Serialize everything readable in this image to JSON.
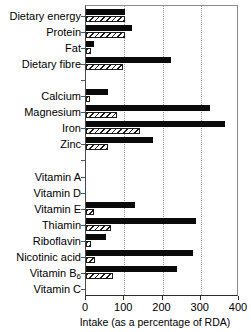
{
  "chart_data": {
    "type": "bar",
    "orientation": "horizontal",
    "title": "",
    "xlabel": "Intake (as a percentage of RDA)",
    "ylabel": "",
    "xlim": [
      0,
      400
    ],
    "xticks": [
      0,
      100,
      200,
      300,
      400
    ],
    "xticklabels": [
      "0",
      "100",
      "200",
      "300",
      "400"
    ],
    "grid": "vertical-dotted",
    "legend": "none",
    "series": [
      {
        "name": "solid",
        "style": "solid-black"
      },
      {
        "name": "hatched",
        "style": "diagonal-hatch"
      }
    ],
    "categories": [
      "Dietary energy",
      "Protein",
      "Fat",
      "Dietary fibre",
      "",
      "Calcium",
      "Magnesium",
      "Iron",
      "Zinc",
      "",
      "Vitamin A",
      "Vitamin D",
      "Vitamin E",
      "Thiamin",
      "Riboflavin",
      "Nicotinic acid",
      "Vitamin B6",
      "Vitamin C"
    ],
    "rows": [
      {
        "label": "Dietary energy",
        "label_sub": "",
        "solid": 103,
        "hatched": 103,
        "spacer": false
      },
      {
        "label": "Protein",
        "label_sub": "",
        "solid": 120,
        "hatched": 103,
        "spacer": false
      },
      {
        "label": "Fat",
        "label_sub": "",
        "solid": 21,
        "hatched": 12,
        "spacer": false
      },
      {
        "label": "Dietary fibre",
        "label_sub": "",
        "solid": 223,
        "hatched": 97,
        "spacer": false
      },
      {
        "label": "",
        "label_sub": "",
        "solid": 0,
        "hatched": 0,
        "spacer": true
      },
      {
        "label": "Calcium",
        "label_sub": "",
        "solid": 58,
        "hatched": 11,
        "spacer": false
      },
      {
        "label": "Magnesium",
        "label_sub": "",
        "solid": 325,
        "hatched": 80,
        "spacer": false
      },
      {
        "label": "Iron",
        "label_sub": "",
        "solid": 363,
        "hatched": 140,
        "spacer": false
      },
      {
        "label": "Zinc",
        "label_sub": "",
        "solid": 176,
        "hatched": 58,
        "spacer": false
      },
      {
        "label": "",
        "label_sub": "",
        "solid": 0,
        "hatched": 0,
        "spacer": true
      },
      {
        "label": "Vitamin A",
        "label_sub": "",
        "solid": 0,
        "hatched": 0,
        "spacer": false
      },
      {
        "label": "Vitamin D",
        "label_sub": "",
        "solid": 0,
        "hatched": 0,
        "spacer": false
      },
      {
        "label": "Vitamin E",
        "label_sub": "",
        "solid": 128,
        "hatched": 21,
        "spacer": false
      },
      {
        "label": "Thiamin",
        "label_sub": "",
        "solid": 288,
        "hatched": 65,
        "spacer": false
      },
      {
        "label": "Riboflavin",
        "label_sub": "",
        "solid": 52,
        "hatched": 13,
        "spacer": false
      },
      {
        "label": "Nicotinic acid",
        "label_sub": "",
        "solid": 281,
        "hatched": 24,
        "spacer": false
      },
      {
        "label": "Vitamin B",
        "label_sub": "6",
        "solid": 238,
        "hatched": 70,
        "spacer": false
      },
      {
        "label": "Vitamin C",
        "label_sub": "",
        "solid": 0,
        "hatched": 0,
        "spacer": false
      }
    ],
    "colors": {
      "solid_bar": "#0a0a0a",
      "hatch_line": "#1a1a1a",
      "hatch_background": "#ffffff",
      "axis": "#2b2b2b",
      "gridline": "#9a9a9a",
      "text": "#000000",
      "page_background": "#ffffff"
    }
  }
}
